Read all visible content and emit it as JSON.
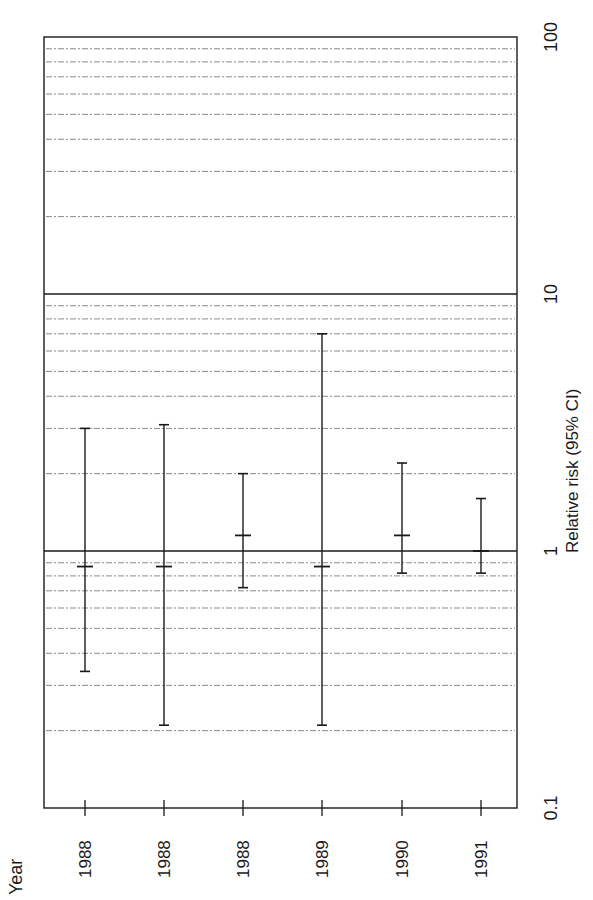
{
  "chart_data": {
    "type": "forest",
    "orientation": "rotated-90",
    "title": "",
    "xlabel": "Year",
    "ylabel": "Relative risk (95% CI)",
    "scale": "log",
    "ylim": [
      0.1,
      100
    ],
    "y_ticks": [
      0.1,
      1,
      10,
      100
    ],
    "y_tick_labels": [
      "0.1",
      "1",
      "10",
      "100"
    ],
    "reference_line": 1,
    "grid": "dotted horizontal minor log gridlines",
    "categories": [
      "1988",
      "1988",
      "1988",
      "1989",
      "1990",
      "1991"
    ],
    "series": [
      {
        "name": "Relative risk",
        "points": [
          {
            "year": "1988",
            "rr": 0.87,
            "lower": 0.34,
            "upper": 3.0
          },
          {
            "year": "1988",
            "rr": 0.87,
            "lower": 0.21,
            "upper": 3.1
          },
          {
            "year": "1988",
            "rr": 1.15,
            "lower": 0.72,
            "upper": 2.0
          },
          {
            "year": "1989",
            "rr": 0.87,
            "lower": 0.21,
            "upper": 7.0
          },
          {
            "year": "1990",
            "rr": 1.15,
            "lower": 0.82,
            "upper": 2.2
          },
          {
            "year": "1991",
            "rr": 1.0,
            "lower": 0.82,
            "upper": 1.6
          }
        ]
      }
    ]
  },
  "labels": {
    "year_axis": "Year",
    "rr_axis": "Relative risk (95% CI)"
  },
  "colors": {
    "ink": "#1a1a1a",
    "grid": "#8a8a8a",
    "background": "#ffffff"
  }
}
